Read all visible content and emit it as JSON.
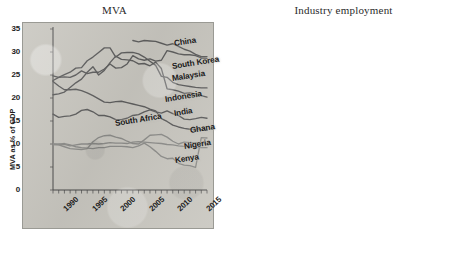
{
  "figure": {
    "background_color": "#ffffff",
    "plot_background_color": "#c9c7c0",
    "line_color": "#5e5e5e"
  },
  "chart_data": [
    {
      "type": "line",
      "panel": "left",
      "title": "MVA",
      "xlabel": "",
      "ylabel": "MVA as % of GDP",
      "xlim": [
        1990,
        2017
      ],
      "ylim": [
        0,
        35
      ],
      "ytick_labels": [
        "0",
        "5",
        "10",
        "15",
        "20",
        "25",
        "30",
        "35"
      ],
      "ytick_values": [
        0,
        5,
        10,
        15,
        20,
        25,
        30,
        35
      ],
      "xtick_labels": [
        "1990",
        "1995",
        "2000",
        "2005",
        "2010",
        "2015"
      ],
      "xtick_values": [
        1990,
        1995,
        2000,
        2005,
        2010,
        2015
      ],
      "grid": false,
      "legend": "inline-labels-right",
      "x": [
        1990,
        1991,
        1992,
        1993,
        1994,
        1995,
        1996,
        1997,
        1998,
        1999,
        2000,
        2001,
        2002,
        2003,
        2004,
        2005,
        2006,
        2007,
        2008,
        2009,
        2010,
        2011,
        2012,
        2013,
        2014,
        2015,
        2016,
        2017
      ],
      "series": [
        {
          "name": "China",
          "label": "China",
          "values": [
            null,
            null,
            null,
            null,
            null,
            null,
            null,
            null,
            null,
            null,
            null,
            null,
            null,
            null,
            32.5,
            32.2,
            32.5,
            32.4,
            32.3,
            31.9,
            31.5,
            31.8,
            31.2,
            30.6,
            30.2,
            29.5,
            29.0,
            29.0
          ]
        },
        {
          "name": "South Korea",
          "label": "South Korea",
          "values": [
            24.8,
            24.5,
            24.6,
            24.5,
            25.0,
            25.9,
            25.3,
            25.6,
            25.6,
            26.3,
            27.4,
            26.5,
            26.6,
            27.4,
            29.2,
            28.5,
            28.2,
            28.5,
            28.0,
            28.2,
            30.3,
            30.0,
            29.6,
            29.4,
            29.4,
            29.2,
            28.7,
            28.6
          ]
        },
        {
          "name": "Malaysia",
          "label": "Malaysia",
          "values": [
            23.8,
            24.5,
            25.1,
            25.6,
            26.5,
            26.6,
            28.1,
            28.9,
            29.9,
            30.9,
            30.9,
            28.9,
            29.8,
            29.9,
            29.9,
            29.6,
            28.9,
            28.0,
            27.1,
            24.7,
            24.5,
            23.4,
            22.9,
            22.7,
            22.5,
            22.3,
            22.2,
            22.2
          ]
        },
        {
          "name": "Indonesia",
          "label": "Indonesia",
          "values": [
            20.7,
            20.9,
            21.3,
            22.3,
            23.3,
            24.1,
            25.6,
            26.8,
            25.0,
            26.0,
            27.7,
            29.1,
            28.4,
            28.3,
            28.1,
            27.4,
            27.5,
            27.0,
            27.8,
            26.4,
            22.0,
            21.8,
            21.5,
            21.0,
            21.1,
            20.9,
            20.5,
            20.2
          ]
        },
        {
          "name": "India",
          "label": "India",
          "values": [
            16.5,
            15.8,
            16.0,
            16.1,
            16.5,
            17.3,
            17.5,
            17.0,
            16.2,
            16.2,
            15.9,
            15.3,
            15.3,
            15.6,
            16.2,
            16.4,
            17.0,
            17.4,
            17.0,
            16.7,
            17.2,
            16.6,
            16.2,
            15.4,
            15.3,
            15.5,
            15.8,
            15.6
          ]
        },
        {
          "name": "South Africa",
          "label": "South Africa",
          "values": [
            23.6,
            22.6,
            21.8,
            21.8,
            21.9,
            21.6,
            21.1,
            20.5,
            19.8,
            19.1,
            19.0,
            19.2,
            19.3,
            19.0,
            18.7,
            18.4,
            18.1,
            17.6,
            17.2,
            15.5,
            14.9,
            14.1,
            13.7,
            13.4,
            13.2,
            13.3,
            13.1,
            13.0
          ]
        },
        {
          "name": "Ghana",
          "label": "Ghana",
          "values": [
            9.8,
            9.9,
            10.1,
            9.8,
            9.4,
            9.2,
            9.1,
            9.0,
            9.2,
            9.2,
            9.5,
            9.5,
            9.5,
            9.4,
            9.2,
            9.6,
            10.2,
            9.4,
            8.4,
            7.3,
            6.8,
            6.9,
            5.8,
            5.4,
            5.3,
            4.9,
            11.4,
            11.3
          ]
        },
        {
          "name": "Nigeria",
          "label": "Nigeria",
          "values": [
            10.0,
            9.8,
            9.4,
            9.0,
            8.9,
            8.8,
            9.0,
            10.5,
            11.4,
            11.8,
            11.9,
            11.5,
            11.2,
            10.6,
            10.1,
            10.0,
            10.9,
            11.9,
            12.0,
            12.1,
            11.5,
            10.6,
            10.0,
            10.4,
            10.3,
            10.3,
            10.2,
            10.0
          ]
        },
        {
          "name": "Kenya",
          "label": "Kenya",
          "values": [
            10.0,
            10.0,
            9.9,
            9.6,
            9.8,
            10.0,
            10.0,
            10.1,
            10.0,
            10.1,
            10.3,
            10.2,
            10.2,
            10.1,
            10.4,
            10.5,
            10.4,
            10.3,
            10.2,
            10.1,
            9.9,
            9.8,
            9.6,
            9.5,
            9.4,
            9.3,
            9.2,
            9.2
          ]
        }
      ]
    },
    {
      "type": "line",
      "panel": "right",
      "title": "Industry employment",
      "xlabel": "",
      "ylabel": "Employment in industry as % of total",
      "xlim": [
        1990,
        2017
      ],
      "ylim": [
        0,
        40
      ],
      "ytick_labels": [
        "0",
        "5",
        "10",
        "15",
        "20",
        "25",
        "30",
        "35",
        "40"
      ],
      "ytick_values": [
        0,
        5,
        10,
        15,
        20,
        25,
        30,
        35,
        40
      ],
      "xtick_labels": [
        "1990",
        "1995",
        "2000",
        "2005",
        "2010",
        "2015"
      ],
      "xtick_values": [
        1990,
        1995,
        2000,
        2005,
        2010,
        2015
      ],
      "grid": false,
      "legend": "inline-labels-right",
      "x": [
        1991,
        1992,
        1993,
        1994,
        1995,
        1996,
        1997,
        1998,
        1999,
        2000,
        2001,
        2002,
        2003,
        2004,
        2005,
        2006,
        2007,
        2008,
        2009,
        2010,
        2011,
        2012,
        2013,
        2014,
        2015,
        2016,
        2017
      ],
      "series": [
        {
          "name": "Malaysia",
          "label": "Malaysia",
          "values": [
            36.8,
            35.7,
            34.8,
            34.0,
            33.5,
            32.9,
            33.7,
            31.0,
            32.0,
            32.6,
            32.2,
            32.8,
            32.0,
            30.5,
            30.1,
            30.2,
            29.6,
            28.9,
            27.6,
            28.1,
            27.8,
            28.4,
            27.9,
            27.5,
            27.1,
            27.0,
            27.0
          ]
        },
        {
          "name": "China",
          "label": "China",
          "values": [
            21.4,
            21.7,
            22.3,
            22.7,
            23.0,
            23.5,
            23.7,
            23.5,
            23.0,
            22.5,
            21.4,
            21.4,
            21.6,
            22.5,
            23.8,
            25.2,
            26.8,
            27.2,
            27.8,
            28.7,
            29.5,
            30.3,
            30.1,
            29.9,
            28.4,
            28.8,
            28.1
          ]
        },
        {
          "name": "South Africa",
          "label": "South Africa",
          "values": [
            31.2,
            31.5,
            31.8,
            31.9,
            30.0,
            29.3,
            28.9,
            28.7,
            28.6,
            28.4,
            28.2,
            27.9,
            27.8,
            26.8,
            25.9,
            25.8,
            26.2,
            26.1,
            25.0,
            24.4,
            24.2,
            24.0,
            23.8,
            23.6,
            23.5,
            23.3,
            23.2
          ]
        },
        {
          "name": "South Korea",
          "label": "South Korea",
          "values": [
            27.7,
            27.3,
            26.7,
            26.3,
            25.5,
            24.9,
            24.4,
            22.4,
            22.0,
            22.5,
            22.2,
            22.0,
            21.6,
            21.4,
            21.3,
            21.0,
            21.0,
            20.8,
            20.6,
            20.6,
            20.5,
            20.7,
            20.8,
            21.0,
            21.2,
            21.5,
            21.6
          ]
        },
        {
          "name": "India",
          "label": "India",
          "values": [
            16.3,
            16.2,
            16.0,
            16.0,
            16.3,
            16.8,
            16.9,
            17.0,
            17.1,
            17.3,
            17.5,
            17.8,
            18.2,
            19.0,
            19.7,
            20.6,
            21.3,
            21.6,
            21.8,
            22.0,
            22.3,
            22.6,
            22.8,
            23.0,
            23.2,
            23.6,
            23.8
          ]
        },
        {
          "name": "Indonesia",
          "label": "Indonesia",
          "values": [
            14.5,
            15.0,
            16.5,
            17.6,
            18.3,
            17.3,
            17.9,
            16.8,
            17.3,
            17.9,
            17.2,
            17.7,
            17.3,
            18.3,
            18.8,
            18.4,
            18.6,
            18.8,
            18.6,
            19.3,
            20.5,
            21.2,
            21.5,
            21.8,
            22.2,
            22.4,
            22.5
          ]
        },
        {
          "name": "Ghana",
          "label": "Ghana",
          "values": [
            14.4,
            14.3,
            14.2,
            14.1,
            14.1,
            14.0,
            14.0,
            14.0,
            14.0,
            14.0,
            14.0,
            14.0,
            14.0,
            14.0,
            14.0,
            13.9,
            13.9,
            13.9,
            13.8,
            13.8,
            13.9,
            16.3,
            18.5,
            20.0,
            21.3,
            22.0,
            22.3
          ]
        },
        {
          "name": "Nigeria",
          "label": "Nigeria",
          "values": [
            12.8,
            12.7,
            12.6,
            12.5,
            12.4,
            12.3,
            12.1,
            11.9,
            11.7,
            11.5,
            11.3,
            11.1,
            11.0,
            10.8,
            10.6,
            10.4,
            10.2,
            10.1,
            10.0,
            10.0,
            10.3,
            10.8,
            11.2,
            11.6,
            11.9,
            12.1,
            12.3
          ]
        },
        {
          "name": "Kenya",
          "label": "Kenya",
          "values": [
            13.2,
            13.0,
            12.8,
            12.3,
            11.7,
            11.0,
            10.2,
            9.4,
            8.7,
            8.1,
            7.6,
            7.2,
            6.9,
            6.6,
            6.3,
            6.1,
            6.1,
            6.1,
            6.1,
            6.2,
            6.3,
            6.4,
            6.5,
            6.7,
            6.9,
            7.1,
            7.2
          ]
        }
      ]
    }
  ]
}
